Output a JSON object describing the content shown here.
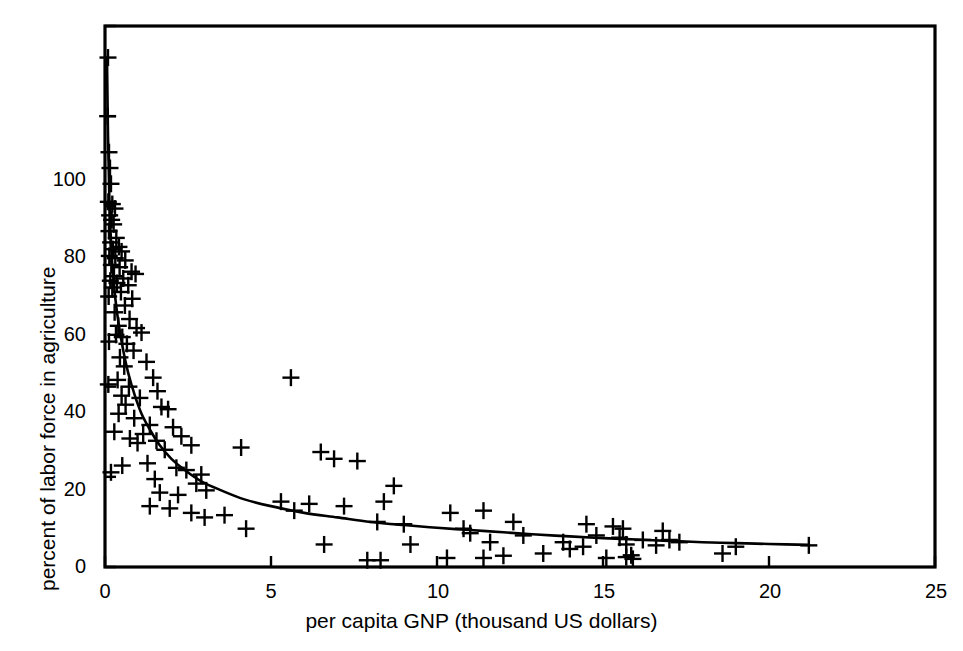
{
  "chart_data": {
    "type": "scatter",
    "title": "",
    "xlabel": "per capita GNP (thousand US dollars)",
    "ylabel": "percent of labor force in agriculture",
    "xlim": [
      0,
      25
    ],
    "ylim": [
      0,
      120
    ],
    "xticks": [
      0,
      5,
      10,
      15,
      20,
      25
    ],
    "xtick_labels": [
      "0",
      "5",
      "10",
      "15",
      "20",
      "25"
    ],
    "yticks": [
      0,
      20,
      40,
      60,
      80,
      100,
      120
    ],
    "ytick_labels": [
      "0",
      "20",
      "40",
      "60",
      "80",
      "100",
      ""
    ],
    "grid": false,
    "legend": null,
    "marker": "plus",
    "marker_color": "#000000",
    "line_color": "#000000",
    "points": [
      [
        0.12,
        92.0
      ],
      [
        0.15,
        88.5
      ],
      [
        0.18,
        85.0
      ],
      [
        0.1,
        81.0
      ],
      [
        0.22,
        80.5
      ],
      [
        0.3,
        79.5
      ],
      [
        0.14,
        78.0
      ],
      [
        0.2,
        77.0
      ],
      [
        0.26,
        76.0
      ],
      [
        0.12,
        74.5
      ],
      [
        0.34,
        73.0
      ],
      [
        0.17,
        72.0
      ],
      [
        0.42,
        71.0
      ],
      [
        0.24,
        70.5
      ],
      [
        0.5,
        70.0
      ],
      [
        0.13,
        69.0
      ],
      [
        0.31,
        68.5
      ],
      [
        0.61,
        68.0
      ],
      [
        0.19,
        67.0
      ],
      [
        0.44,
        66.5
      ],
      [
        0.8,
        65.5
      ],
      [
        0.92,
        65.0
      ],
      [
        0.27,
        64.5
      ],
      [
        0.55,
        64.0
      ],
      [
        0.16,
        63.5
      ],
      [
        0.36,
        63.0
      ],
      [
        0.7,
        62.5
      ],
      [
        0.22,
        62.0
      ],
      [
        0.48,
        61.0
      ],
      [
        0.11,
        60.0
      ],
      [
        0.82,
        59.5
      ],
      [
        0.6,
        58.0
      ],
      [
        0.29,
        56.5
      ],
      [
        0.74,
        55.0
      ],
      [
        0.4,
        53.5
      ],
      [
        0.95,
        53.0
      ],
      [
        1.1,
        52.0
      ],
      [
        0.33,
        51.5
      ],
      [
        0.52,
        51.0
      ],
      [
        0.12,
        50.0
      ],
      [
        0.66,
        49.5
      ],
      [
        0.86,
        48.0
      ],
      [
        0.45,
        46.5
      ],
      [
        1.25,
        45.5
      ],
      [
        0.58,
        44.5
      ],
      [
        1.45,
        42.0
      ],
      [
        0.38,
        41.5
      ],
      [
        0.1,
        40.5
      ],
      [
        0.72,
        40.0
      ],
      [
        1.58,
        39.0
      ],
      [
        0.5,
        38.0
      ],
      [
        1.05,
        37.5
      ],
      [
        0.62,
        36.0
      ],
      [
        1.7,
        35.5
      ],
      [
        1.9,
        35.0
      ],
      [
        0.41,
        34.0
      ],
      [
        0.88,
        33.0
      ],
      [
        1.35,
        31.5
      ],
      [
        2.05,
        31.0
      ],
      [
        0.28,
        30.0
      ],
      [
        1.15,
        29.5
      ],
      [
        2.3,
        29.0
      ],
      [
        0.75,
        28.5
      ],
      [
        1.55,
        28.0
      ],
      [
        0.98,
        27.5
      ],
      [
        2.6,
        27.0
      ],
      [
        4.1,
        26.5
      ],
      [
        1.8,
        26.0
      ],
      [
        6.5,
        25.5
      ],
      [
        6.9,
        24.0
      ],
      [
        7.6,
        23.5
      ],
      [
        1.28,
        23.0
      ],
      [
        0.52,
        22.5
      ],
      [
        2.15,
        22.0
      ],
      [
        2.45,
        21.5
      ],
      [
        0.18,
        21.0
      ],
      [
        2.9,
        20.5
      ],
      [
        5.6,
        42.0
      ],
      [
        1.5,
        19.5
      ],
      [
        2.75,
        18.5
      ],
      [
        8.7,
        18.0
      ],
      [
        3.05,
        17.0
      ],
      [
        1.65,
        16.5
      ],
      [
        2.2,
        16.0
      ],
      [
        5.3,
        14.5
      ],
      [
        6.15,
        14.0
      ],
      [
        7.2,
        13.5
      ],
      [
        8.4,
        14.5
      ],
      [
        1.35,
        13.5
      ],
      [
        1.95,
        13.0
      ],
      [
        10.4,
        12.0
      ],
      [
        11.4,
        12.5
      ],
      [
        5.7,
        12.5
      ],
      [
        2.6,
        12.0
      ],
      [
        3.0,
        11.0
      ],
      [
        8.2,
        10.0
      ],
      [
        9.0,
        9.5
      ],
      [
        12.3,
        10.0
      ],
      [
        10.8,
        8.5
      ],
      [
        14.5,
        9.5
      ],
      [
        15.3,
        9.0
      ],
      [
        15.6,
        8.5
      ],
      [
        4.25,
        8.5
      ],
      [
        11.0,
        7.5
      ],
      [
        16.8,
        8.0
      ],
      [
        12.6,
        7.0
      ],
      [
        14.8,
        7.0
      ],
      [
        15.5,
        6.5
      ],
      [
        17.0,
        6.0
      ],
      [
        16.2,
        6.0
      ],
      [
        13.8,
        5.5
      ],
      [
        6.6,
        5.0
      ],
      [
        11.6,
        5.5
      ],
      [
        15.7,
        5.0
      ],
      [
        14.4,
        4.5
      ],
      [
        16.6,
        4.8
      ],
      [
        18.6,
        3.0
      ],
      [
        7.9,
        1.5
      ],
      [
        8.3,
        1.5
      ],
      [
        10.3,
        2.0
      ],
      [
        11.4,
        2.0
      ],
      [
        12.0,
        2.5
      ],
      [
        15.1,
        2.0
      ],
      [
        15.7,
        2.2
      ],
      [
        15.85,
        2.6
      ],
      [
        15.9,
        1.8
      ],
      [
        9.2,
        5.0
      ],
      [
        3.6,
        11.5
      ],
      [
        21.2,
        4.8
      ],
      [
        0.08,
        100.0
      ],
      [
        13.2,
        3.0
      ],
      [
        14.0,
        4.0
      ],
      [
        17.3,
        5.5
      ],
      [
        19.0,
        4.5
      ],
      [
        0.09,
        113.0
      ]
    ],
    "fit_curve": {
      "description": "monotone decreasing fitted curve",
      "points": [
        [
          0.06,
          113.0
        ],
        [
          0.09,
          96.0
        ],
        [
          0.13,
          82.0
        ],
        [
          0.18,
          72.0
        ],
        [
          0.24,
          65.0
        ],
        [
          0.32,
          59.0
        ],
        [
          0.42,
          53.5
        ],
        [
          0.55,
          48.0
        ],
        [
          0.7,
          43.0
        ],
        [
          0.9,
          38.0
        ],
        [
          1.1,
          34.0
        ],
        [
          1.35,
          30.5
        ],
        [
          1.65,
          27.0
        ],
        [
          2.0,
          24.0
        ],
        [
          2.4,
          21.5
        ],
        [
          2.9,
          19.0
        ],
        [
          3.5,
          17.0
        ],
        [
          4.2,
          15.0
        ],
        [
          5.0,
          13.5
        ],
        [
          6.0,
          12.0
        ],
        [
          7.0,
          11.0
        ],
        [
          8.0,
          10.0
        ],
        [
          9.0,
          9.3
        ],
        [
          10.0,
          8.7
        ],
        [
          11.0,
          8.2
        ],
        [
          12.0,
          7.7
        ],
        [
          13.0,
          7.2
        ],
        [
          14.0,
          6.8
        ],
        [
          15.0,
          6.4
        ],
        [
          16.0,
          6.1
        ],
        [
          17.0,
          5.8
        ],
        [
          18.0,
          5.5
        ],
        [
          19.0,
          5.3
        ],
        [
          20.0,
          5.1
        ],
        [
          21.2,
          4.9
        ]
      ]
    }
  },
  "axes": {
    "x_title": "per capita GNP (thousand US dollars)",
    "y_title": "percent of labor force in agriculture",
    "x_tick_labels": [
      "0",
      "5",
      "10",
      "15",
      "20",
      "25"
    ],
    "y_tick_labels": [
      "100",
      "80",
      "60",
      "40",
      "20",
      "0"
    ]
  },
  "style": {
    "frame_color": "#000000",
    "background": "#ffffff"
  }
}
